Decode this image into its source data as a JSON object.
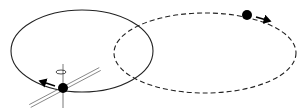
{
  "diagram": {
    "colors": {
      "background": "#ffffff",
      "stroke": "#222222",
      "body": "#000000",
      "axis_lines": "#555555"
    },
    "orbits": [
      {
        "name": "solid-orbit",
        "style": "solid",
        "cx": 82,
        "cy": 51,
        "rx": 71,
        "ry": 41
      },
      {
        "name": "dashed-orbit",
        "style": "dashed",
        "cx": 205,
        "cy": 53,
        "rx": 91,
        "ry": 40
      }
    ],
    "bodies": [
      {
        "name": "spinning-body",
        "x": 63,
        "y": 88,
        "r": 5,
        "direction_arrow": {
          "from": [
            55,
            86
          ],
          "to": [
            40,
            81
          ]
        },
        "spin_axis": {
          "top": [
            63,
            64
          ],
          "bottom": [
            63,
            108
          ]
        },
        "spin_indicator": {
          "cx": 61,
          "cy": 72,
          "rx": 5,
          "ry": 2
        },
        "tilted_plane": {
          "from": [
            30,
            106
          ],
          "to": [
            100,
            69
          ]
        }
      },
      {
        "name": "orbiting-body",
        "x": 247,
        "y": 15,
        "r": 5,
        "direction_arrow": {
          "from": [
            256,
            17
          ],
          "to": [
            270,
            21
          ]
        }
      }
    ]
  }
}
